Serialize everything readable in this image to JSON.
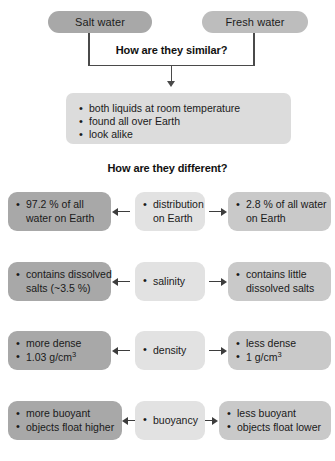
{
  "diagram": {
    "top": {
      "left_pill": "Salt water",
      "right_pill": "Fresh water"
    },
    "similar": {
      "heading": "How are they similar?",
      "items": [
        "both liquids at room temperature",
        "found all over Earth",
        "look alike"
      ]
    },
    "different": {
      "heading": "How are they different?",
      "rows": [
        {
          "property": "distribution",
          "property_line2": "on Earth",
          "left": [
            "97.2 % of all",
            "water on Earth"
          ],
          "right": [
            "2.8 % of all water",
            "on Earth"
          ]
        },
        {
          "property": "salinity",
          "property_line2": "",
          "left": [
            "contains dissolved",
            "salts (~3.5 %)"
          ],
          "right": [
            "contains little",
            "dissolved salts"
          ]
        },
        {
          "property": "density",
          "property_line2": "",
          "left": [
            "more dense",
            "1.03 g/cm3"
          ],
          "right": [
            "less dense",
            "1 g/cm3"
          ]
        },
        {
          "property": "buoyancy",
          "property_line2": "",
          "left": [
            "more buoyant",
            "objects float higher"
          ],
          "right": [
            "less buoyant",
            "objects float lower"
          ]
        }
      ]
    },
    "colors": {
      "salt_water_box": "#a8a8a8",
      "fresh_water_box": "#bdbdbd",
      "property_box": "#e2e2e2",
      "similar_panel": "#dcdcdc",
      "right_box": "#c9c9c9",
      "connector": "#4a4a4a"
    }
  }
}
